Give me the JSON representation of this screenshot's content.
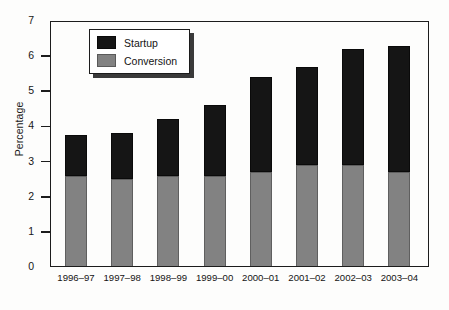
{
  "chart_data": {
    "type": "bar",
    "stacked": true,
    "title": "",
    "subtitle": "",
    "xlabel": "",
    "ylabel": "Percentage",
    "ylim": [
      0,
      7
    ],
    "ytick_labels": [
      "0",
      "1",
      "2",
      "3",
      "4",
      "5",
      "6",
      "7"
    ],
    "ytick_values": [
      0,
      1,
      2,
      3,
      4,
      5,
      6,
      7
    ],
    "grid": false,
    "legend_position": "top-left-inside",
    "categories": [
      "1996–97",
      "1997–98",
      "1998–99",
      "1999–00",
      "2000–01",
      "2001–02",
      "2002–03",
      "2003–04"
    ],
    "series": [
      {
        "name": "Conversion",
        "color": "#828282",
        "values": [
          2.6,
          2.5,
          2.6,
          2.6,
          2.7,
          2.9,
          2.9,
          2.7
        ]
      },
      {
        "name": "Startup",
        "color": "#151515",
        "values": [
          1.15,
          1.3,
          1.6,
          2.0,
          2.7,
          2.8,
          3.3,
          3.6
        ]
      }
    ],
    "totals": [
      3.75,
      3.8,
      4.2,
      4.6,
      5.4,
      5.7,
      6.2,
      6.3
    ]
  },
  "legend": {
    "items": [
      {
        "label": "Startup",
        "swatch": "black-swatch"
      },
      {
        "label": "Conversion",
        "swatch": "gray-swatch"
      }
    ]
  },
  "colors": {
    "startup": "#151515",
    "conversion": "#828282",
    "axis": "#1c1c1c",
    "background": "#fdfdfc"
  }
}
